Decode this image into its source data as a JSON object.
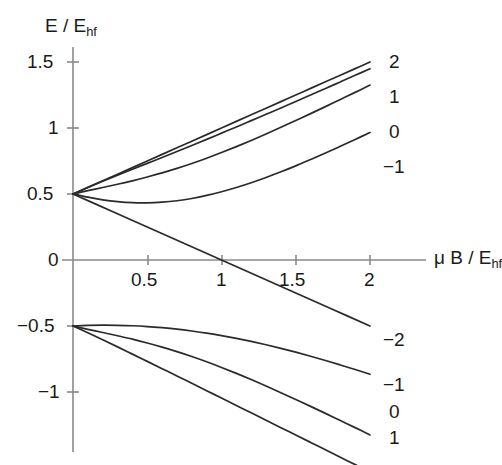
{
  "chart_data": {
    "type": "line",
    "title": "",
    "xlabel": "μ B / E_hf",
    "ylabel": "E / E_hf",
    "xlim": [
      0,
      2.22
    ],
    "ylim": [
      -1.35,
      1.62
    ],
    "grid": false,
    "legend": "inline-right-labels",
    "xticks": [
      0.5,
      1,
      1.5,
      2
    ],
    "xticklabels": [
      "0.5",
      "1",
      "1.5",
      "2"
    ],
    "yticks": [
      1.5,
      1,
      0.5,
      0,
      -0.5,
      -1
    ],
    "yticklabels": [
      "1.5",
      "1",
      "0.5",
      "0",
      "−0.5",
      "−1"
    ],
    "series": [
      {
        "name": "2",
        "label": "2",
        "manifold": "upper",
        "label_value": 2,
        "x": [
          0,
          0.1,
          0.2,
          0.3,
          0.4,
          0.5,
          0.6,
          0.7,
          0.8,
          0.9,
          1.0,
          1.1,
          1.2,
          1.3,
          1.4,
          1.5,
          1.6,
          1.7,
          1.8,
          1.9,
          2.0
        ],
        "y": [
          0.5,
          0.55,
          0.6,
          0.65,
          0.7,
          0.75,
          0.8,
          0.85,
          0.9,
          0.95,
          1.0,
          1.05,
          1.1,
          1.15,
          1.2,
          1.25,
          1.3,
          1.35,
          1.4,
          1.45,
          1.5
        ]
      },
      {
        "name": "1",
        "label": "1",
        "manifold": "upper",
        "label_value": 1,
        "x": [
          0,
          0.1,
          0.2,
          0.3,
          0.4,
          0.5,
          0.6,
          0.7,
          0.8,
          0.9,
          1.0,
          1.1,
          1.2,
          1.3,
          1.4,
          1.5,
          1.6,
          1.7,
          1.8,
          1.9,
          2.0
        ],
        "y": [
          0.5,
          0.549,
          0.596,
          0.642,
          0.687,
          0.732,
          0.777,
          0.822,
          0.868,
          0.914,
          0.961,
          1.008,
          1.056,
          1.104,
          1.152,
          1.201,
          1.25,
          1.299,
          1.349,
          1.399,
          1.449
        ]
      },
      {
        "name": "0",
        "label": "0",
        "manifold": "upper",
        "label_value": 0,
        "x": [
          0,
          0.1,
          0.2,
          0.3,
          0.4,
          0.5,
          0.6,
          0.7,
          0.8,
          0.9,
          1.0,
          1.1,
          1.2,
          1.3,
          1.4,
          1.5,
          1.6,
          1.7,
          1.8,
          1.9,
          2.0
        ],
        "y": [
          0.5,
          0.525,
          0.549,
          0.574,
          0.6,
          0.629,
          0.66,
          0.694,
          0.731,
          0.771,
          0.814,
          0.859,
          0.906,
          0.955,
          1.005,
          1.057,
          1.109,
          1.162,
          1.216,
          1.27,
          1.325
        ]
      },
      {
        "name": "-1",
        "label": "−1",
        "manifold": "upper",
        "label_value": -1,
        "x": [
          0,
          0.1,
          0.2,
          0.3,
          0.4,
          0.5,
          0.6,
          0.7,
          0.8,
          0.9,
          1.0,
          1.1,
          1.2,
          1.3,
          1.4,
          1.5,
          1.6,
          1.7,
          1.8,
          1.9,
          2.0
        ],
        "y": [
          0.5,
          0.476,
          0.456,
          0.442,
          0.434,
          0.433,
          0.438,
          0.449,
          0.466,
          0.489,
          0.517,
          0.549,
          0.585,
          0.625,
          0.668,
          0.713,
          0.761,
          0.81,
          0.861,
          0.913,
          0.966
        ]
      },
      {
        "name": "-2",
        "label": "−2",
        "manifold": "upper-descending",
        "label_value": -2,
        "x": [
          0,
          0.25,
          0.5,
          0.75,
          1.0,
          1.25,
          1.5,
          1.75,
          2.0
        ],
        "y": [
          0.5,
          0.375,
          0.25,
          0.125,
          0.0,
          -0.125,
          -0.25,
          -0.375,
          -0.5
        ]
      },
      {
        "name": "lower-1",
        "label": "−1",
        "manifold": "lower",
        "label_value": -1,
        "x": [
          0,
          0.1,
          0.2,
          0.3,
          0.4,
          0.5,
          0.6,
          0.7,
          0.8,
          0.9,
          1.0,
          1.1,
          1.2,
          1.3,
          1.4,
          1.5,
          1.6,
          1.7,
          1.8,
          1.9,
          2.0
        ],
        "y": [
          -0.5,
          -0.496,
          -0.494,
          -0.495,
          -0.498,
          -0.504,
          -0.513,
          -0.524,
          -0.538,
          -0.554,
          -0.573,
          -0.594,
          -0.617,
          -0.642,
          -0.669,
          -0.698,
          -0.729,
          -0.761,
          -0.795,
          -0.83,
          -0.866
        ]
      },
      {
        "name": "lower0",
        "label": "0",
        "manifold": "lower",
        "label_value": 0,
        "x": [
          0,
          0.1,
          0.2,
          0.3,
          0.4,
          0.5,
          0.6,
          0.7,
          0.8,
          0.9,
          1.0,
          1.1,
          1.2,
          1.3,
          1.4,
          1.5,
          1.6,
          1.7,
          1.8,
          1.9,
          2.0
        ],
        "y": [
          -0.5,
          -0.525,
          -0.549,
          -0.574,
          -0.6,
          -0.629,
          -0.66,
          -0.694,
          -0.731,
          -0.771,
          -0.814,
          -0.859,
          -0.906,
          -0.955,
          -1.005,
          -1.057,
          -1.109,
          -1.162,
          -1.216,
          -1.27,
          -1.325
        ]
      },
      {
        "name": "lower1",
        "label": "1",
        "manifold": "lower",
        "label_value": 1,
        "x": [
          0,
          0.1,
          0.2,
          0.3,
          0.4,
          0.5,
          0.6,
          0.7,
          0.8,
          0.9,
          1.0,
          1.1,
          1.2,
          1.3,
          1.4,
          1.5,
          1.6,
          1.7,
          1.8,
          1.9,
          2.0
        ],
        "y": [
          -0.5,
          -0.551,
          -0.604,
          -0.658,
          -0.713,
          -0.768,
          -0.823,
          -0.878,
          -0.934,
          -0.99,
          -1.046,
          -1.102,
          -1.158,
          -1.214,
          -1.27,
          -1.326,
          -1.382,
          -1.438,
          -1.494,
          -1.55,
          -1.606
        ]
      }
    ]
  },
  "axes": {
    "ylabel_main": "E / E",
    "ylabel_sub": "hf",
    "xlabel_mu": "μ B / E",
    "xlabel_sub": "hf"
  },
  "yticks": [
    {
      "value": 1.5,
      "label": "1.5"
    },
    {
      "value": 1,
      "label": "1"
    },
    {
      "value": 0.5,
      "label": "0.5"
    },
    {
      "value": 0,
      "label": "0"
    },
    {
      "value": -0.5,
      "label": "−0.5"
    },
    {
      "value": -1,
      "label": "−1"
    }
  ],
  "xticks": [
    {
      "value": 0.5,
      "label": "0.5"
    },
    {
      "value": 1,
      "label": "1"
    },
    {
      "value": 1.5,
      "label": "1.5"
    },
    {
      "value": 2,
      "label": "2"
    }
  ],
  "curve_labels_upper": [
    {
      "label": "2"
    },
    {
      "label": "1"
    },
    {
      "label": "0"
    },
    {
      "label": "−1"
    }
  ],
  "curve_labels_lower": [
    {
      "label": "−2"
    },
    {
      "label": "−1"
    },
    {
      "label": "0"
    },
    {
      "label": "1"
    }
  ],
  "colors": {
    "curve": "#2a2a2a",
    "axis": "#8a8a8a",
    "text": "#1a1a1a",
    "background": "#ffffff"
  }
}
